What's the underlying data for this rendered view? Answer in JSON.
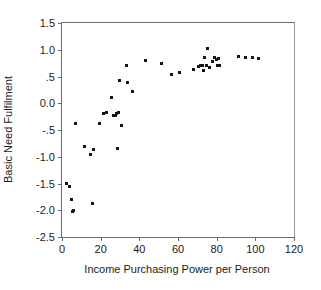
{
  "chart_data": {
    "type": "scatter",
    "title": "",
    "xlabel": "Income Purchasing Power per Person",
    "ylabel": "Basic Need Fulfilment",
    "xlim": [
      0,
      120
    ],
    "ylim": [
      -2.5,
      1.5
    ],
    "xticks": [
      0,
      20,
      40,
      60,
      80,
      100,
      120
    ],
    "xtick_labels": [
      "0",
      "20",
      "40",
      "60",
      "80",
      "100",
      "120"
    ],
    "yticks": [
      -2.5,
      -2.0,
      -1.5,
      -1.0,
      -0.5,
      0.0,
      0.5,
      1.0,
      1.5
    ],
    "ytick_labels": [
      "-2.5",
      "-2.0",
      "-1.5",
      "-1.0",
      "-.5",
      "0.0",
      ".5",
      "1.0",
      "1.5"
    ],
    "grid": false,
    "legend": null,
    "marker": "square",
    "marker_color": "#151515",
    "points": [
      [
        2.5,
        -1.5
      ],
      [
        4.0,
        -1.55
      ],
      [
        5.0,
        -1.8
      ],
      [
        5.5,
        -2.03
      ],
      [
        6.2,
        -2.01
      ],
      [
        6.8,
        -0.38
      ],
      [
        11.5,
        -0.81
      ],
      [
        14.5,
        -0.96
      ],
      [
        16.0,
        -1.87
      ],
      [
        16.5,
        -0.86
      ],
      [
        19.5,
        -0.38
      ],
      [
        21.5,
        -0.19
      ],
      [
        23.0,
        -0.18
      ],
      [
        25.5,
        0.1
      ],
      [
        26.5,
        -0.22
      ],
      [
        27.5,
        -0.23
      ],
      [
        28.0,
        -0.2
      ],
      [
        28.5,
        -0.84
      ],
      [
        29.0,
        -0.18
      ],
      [
        29.5,
        0.43
      ],
      [
        31.0,
        -0.41
      ],
      [
        33.5,
        0.71
      ],
      [
        34.0,
        0.38
      ],
      [
        36.5,
        0.22
      ],
      [
        43.0,
        0.79
      ],
      [
        51.5,
        0.75
      ],
      [
        56.5,
        0.54
      ],
      [
        61.0,
        0.58
      ],
      [
        68.0,
        0.63
      ],
      [
        70.5,
        0.69
      ],
      [
        71.5,
        0.7
      ],
      [
        72.5,
        0.7
      ],
      [
        73.0,
        0.62
      ],
      [
        73.5,
        0.86
      ],
      [
        74.5,
        0.7
      ],
      [
        75.5,
        1.03
      ],
      [
        76.5,
        0.66
      ],
      [
        78.0,
        0.78
      ],
      [
        79.0,
        0.86
      ],
      [
        80.0,
        0.82
      ],
      [
        80.5,
        0.7
      ],
      [
        81.0,
        0.83
      ],
      [
        81.5,
        0.71
      ],
      [
        91.5,
        0.87
      ],
      [
        95.0,
        0.86
      ],
      [
        98.5,
        0.86
      ],
      [
        101.5,
        0.84
      ]
    ]
  }
}
